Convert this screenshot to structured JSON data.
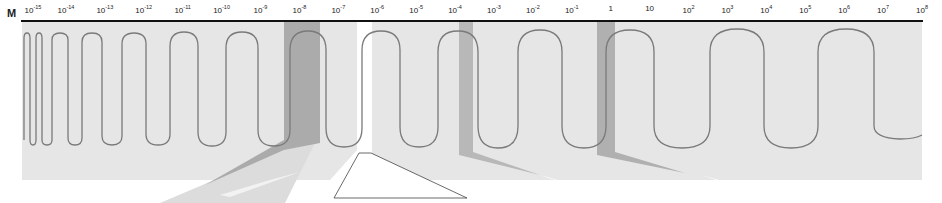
{
  "axis": {
    "unit_label": "M",
    "scale": "logarithmic",
    "ticks": [
      {
        "base": "10",
        "exp": "-15"
      },
      {
        "base": "10",
        "exp": "-14"
      },
      {
        "base": "10",
        "exp": "-13"
      },
      {
        "base": "10",
        "exp": "-12"
      },
      {
        "base": "10",
        "exp": "-11"
      },
      {
        "base": "10",
        "exp": "-10"
      },
      {
        "base": "10",
        "exp": "-9"
      },
      {
        "base": "10",
        "exp": "-8"
      },
      {
        "base": "10",
        "exp": "-7"
      },
      {
        "base": "10",
        "exp": "-6"
      },
      {
        "base": "10",
        "exp": "-5"
      },
      {
        "base": "10",
        "exp": "-4"
      },
      {
        "base": "10",
        "exp": "-3"
      },
      {
        "base": "10",
        "exp": "-2"
      },
      {
        "base": "10",
        "exp": "-1"
      },
      {
        "base": "1",
        "exp": ""
      },
      {
        "base": "10",
        "exp": ""
      },
      {
        "base": "10",
        "exp": "2"
      },
      {
        "base": "10",
        "exp": "3"
      },
      {
        "base": "10",
        "exp": "4"
      },
      {
        "base": "10",
        "exp": "5"
      },
      {
        "base": "10",
        "exp": "6"
      },
      {
        "base": "10",
        "exp": "7"
      },
      {
        "base": "10",
        "exp": "8"
      }
    ]
  },
  "colors": {
    "background": "#ffffff",
    "band_light": "#e4e4e4",
    "band_dark": "#b4b4b4",
    "visible_gap": "#ffffff",
    "wave": "#7a7a7a",
    "axis": "#111111"
  }
}
